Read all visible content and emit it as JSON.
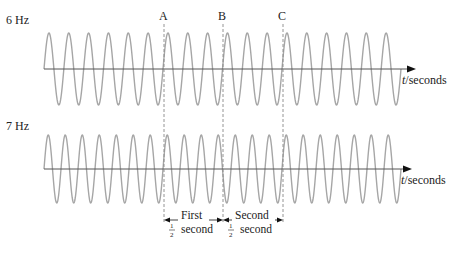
{
  "diagram": {
    "top": {
      "label": "6 Hz",
      "frequency_hz": 6,
      "axis_label_t": "t",
      "axis_label_unit": "/seconds",
      "markers": [
        "A",
        "B",
        "C"
      ]
    },
    "bottom": {
      "label": "7 Hz",
      "frequency_hz": 7,
      "axis_label_t": "t",
      "axis_label_unit": "/seconds"
    },
    "intervals": [
      {
        "line1": "First",
        "fraction_num": "1",
        "fraction_den": "2",
        "line2": "second"
      },
      {
        "line1": "Second",
        "fraction_num": "1",
        "fraction_den": "2",
        "line2": "second"
      }
    ],
    "colors": {
      "wave": "#a6a6a6",
      "axis": "#555555",
      "dashed": "#888888",
      "text": "#222222"
    }
  }
}
